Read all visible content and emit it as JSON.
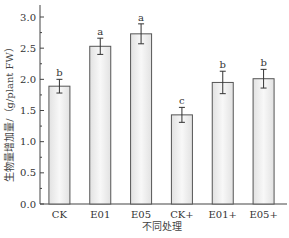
{
  "chart_data": {
    "type": "bar",
    "title": "",
    "xlabel": "不同处理",
    "ylabel": "生物量增加量/（g/plant FW）",
    "ylim": [
      0,
      3.0
    ],
    "yticks": [
      "0.0",
      "0.5",
      "1.0",
      "1.5",
      "2.0",
      "2.5",
      "3.0"
    ],
    "grid": false,
    "legend": null,
    "categories": [
      "CK",
      "E01",
      "E05",
      "CK+",
      "E01+",
      "E05+"
    ],
    "values": [
      1.89,
      2.53,
      2.73,
      1.43,
      1.95,
      2.01
    ],
    "errors": [
      0.11,
      0.13,
      0.16,
      0.12,
      0.18,
      0.15
    ],
    "significance": [
      "b",
      "a",
      "a",
      "c",
      "b",
      "b"
    ]
  },
  "colors": {
    "bar_fill_edge": "#e4e4e4",
    "bar_fill_center": "#f7f7f7",
    "bar_stroke": "#555555",
    "axis": "#444444"
  }
}
